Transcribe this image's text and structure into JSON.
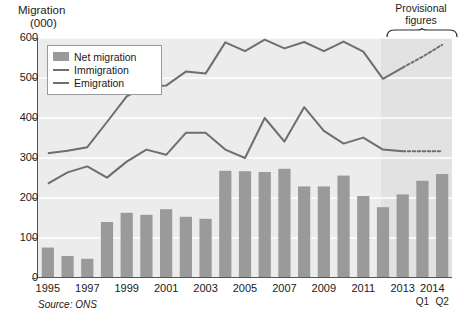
{
  "title": {
    "line1": "Migration",
    "line2": "(000)"
  },
  "annotation": {
    "line1": "Provisional",
    "line2": "figures"
  },
  "source": "Source: ONS",
  "legend": [
    {
      "key": "net",
      "label": "Net migration",
      "style": "swatch"
    },
    {
      "key": "immigration",
      "label": "Immigration",
      "style": "line"
    },
    {
      "key": "emigration",
      "label": "Emigration",
      "style": "line"
    }
  ],
  "colors": {
    "bar": "#9a9a9a",
    "line": "#6e6e6e",
    "plot_bg": "#ececec",
    "prov_bg": "#e2e2e2",
    "gridline": "#ffffff",
    "axis": "#555555"
  },
  "chart_data": {
    "type": "bar",
    "title": "Migration (000)",
    "xlabel": "",
    "ylabel": "Migration (000)",
    "ylim": [
      0,
      600
    ],
    "yticks": [
      0,
      100,
      200,
      300,
      400,
      500,
      600
    ],
    "ytick_labels": [
      "0",
      "100",
      "200",
      "300",
      "400",
      "500",
      "600"
    ],
    "grid": true,
    "legend_position": "top-left-inside",
    "categories": [
      "1995",
      "1996",
      "1997",
      "1998",
      "1999",
      "2000",
      "2001",
      "2002",
      "2003",
      "2004",
      "2005",
      "2006",
      "2007",
      "2008",
      "2009",
      "2010",
      "2011",
      "2012",
      "2013",
      "2014 Q1",
      "2014 Q2"
    ],
    "xtick_labels": [
      "1995",
      "1997",
      "1999",
      "2001",
      "2003",
      "2005",
      "2007",
      "2009",
      "2011",
      "2013",
      "2014"
    ],
    "xtick_sublabels": [
      "Q1",
      "Q2"
    ],
    "provisional_from": "2014 Q1",
    "series": [
      {
        "name": "Net migration",
        "type": "bar",
        "values": [
          76,
          55,
          48,
          140,
          163,
          158,
          172,
          153,
          148,
          268,
          267,
          265,
          273,
          229,
          229,
          256,
          205,
          177,
          209,
          243,
          260
        ]
      },
      {
        "name": "Immigration",
        "type": "line",
        "values": [
          312,
          318,
          327,
          390,
          454,
          479,
          481,
          516,
          511,
          589,
          567,
          596,
          574,
          590,
          567,
          591,
          566,
          498,
          526,
          553,
          583
        ]
      },
      {
        "name": "Emigration",
        "type": "line",
        "values": [
          236,
          264,
          279,
          251,
          291,
          321,
          308,
          363,
          363,
          321,
          300,
          400,
          341,
          427,
          368,
          336,
          351,
          321,
          317,
          317,
          317
        ]
      }
    ]
  }
}
